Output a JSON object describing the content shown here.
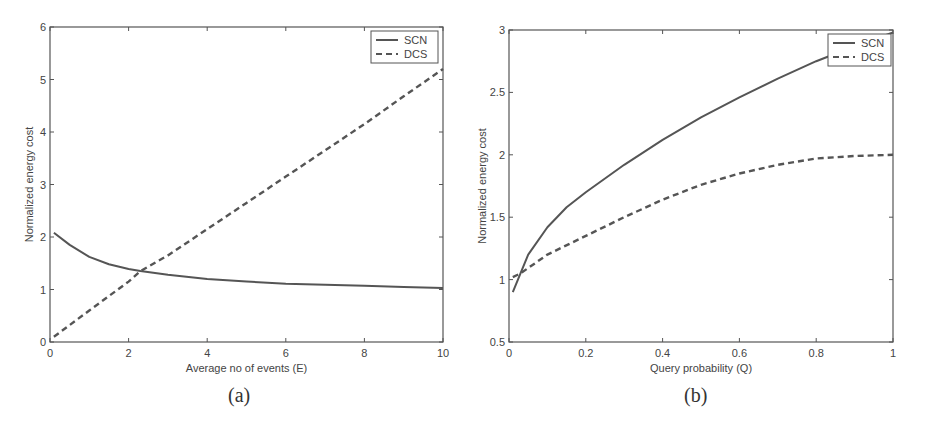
{
  "chart_data": [
    {
      "id": "a",
      "type": "line",
      "caption": "(a)",
      "title": "",
      "xlabel": "Average no of events (E)",
      "ylabel": "Normalized energy cost",
      "xlim": [
        0,
        10
      ],
      "ylim": [
        0,
        6
      ],
      "xticks": [
        0,
        2,
        4,
        6,
        8,
        10
      ],
      "yticks": [
        0,
        1,
        2,
        3,
        4,
        5,
        6
      ],
      "grid": false,
      "legend_position": "upper right",
      "series": [
        {
          "name": "SCN",
          "style": "solid",
          "x": [
            0.1,
            0.5,
            1,
            1.5,
            2,
            2.3,
            3,
            4,
            5,
            6,
            7,
            8,
            9,
            10
          ],
          "y": [
            2.08,
            1.85,
            1.62,
            1.48,
            1.39,
            1.35,
            1.28,
            1.2,
            1.15,
            1.11,
            1.09,
            1.07,
            1.05,
            1.03
          ]
        },
        {
          "name": "DCS",
          "style": "dashed",
          "x": [
            0.1,
            1,
            2,
            2.3,
            3,
            4,
            5,
            6,
            7,
            8,
            9,
            10
          ],
          "y": [
            0.1,
            0.6,
            1.15,
            1.35,
            1.65,
            2.15,
            2.65,
            3.15,
            3.65,
            4.15,
            4.68,
            5.2
          ]
        }
      ]
    },
    {
      "id": "b",
      "type": "line",
      "caption": "(b)",
      "title": "",
      "xlabel": "Query probability (Q)",
      "ylabel": "Normalized energy cost",
      "xlim": [
        0,
        1
      ],
      "ylim": [
        0.5,
        3
      ],
      "xticks": [
        0,
        0.2,
        0.4,
        0.6,
        0.8,
        1
      ],
      "yticks": [
        0.5,
        1,
        1.5,
        2,
        2.5,
        3
      ],
      "ytick_labels": [
        "0.5",
        "1",
        "1.5",
        "2",
        "2.5",
        "3"
      ],
      "grid": false,
      "legend_position": "upper right",
      "series": [
        {
          "name": "SCN",
          "style": "solid",
          "x": [
            0.01,
            0.03,
            0.05,
            0.1,
            0.15,
            0.2,
            0.3,
            0.4,
            0.5,
            0.6,
            0.7,
            0.8,
            0.9,
            1.0
          ],
          "y": [
            0.9,
            1.05,
            1.2,
            1.42,
            1.58,
            1.7,
            1.92,
            2.12,
            2.3,
            2.46,
            2.61,
            2.75,
            2.87,
            2.98
          ]
        },
        {
          "name": "DCS",
          "style": "dashed",
          "x": [
            0.01,
            0.03,
            0.1,
            0.2,
            0.3,
            0.4,
            0.5,
            0.6,
            0.7,
            0.8,
            0.9,
            1.0
          ],
          "y": [
            1.02,
            1.05,
            1.2,
            1.35,
            1.5,
            1.64,
            1.76,
            1.85,
            1.92,
            1.97,
            1.99,
            2.0
          ]
        }
      ]
    }
  ],
  "colors": {
    "line": "#555555",
    "axis": "#555555",
    "text": "#444444"
  }
}
